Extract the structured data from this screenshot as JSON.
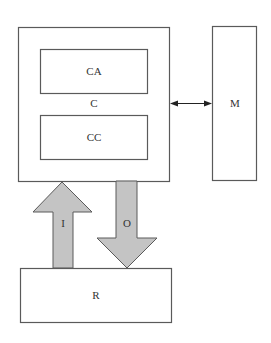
{
  "diagram": {
    "nodes": {
      "computer": {
        "label": "C"
      },
      "control_a": {
        "label": "CA"
      },
      "control_c": {
        "label": "CC"
      },
      "memory": {
        "label": "M"
      },
      "resource": {
        "label": "R"
      }
    },
    "flows": {
      "input": {
        "label": "I",
        "direction": "R to C"
      },
      "output": {
        "label": "O",
        "direction": "C to R"
      },
      "bidirectional": {
        "from": "C",
        "to": "M"
      }
    },
    "colors": {
      "box_stroke": "#5a5a5a",
      "arrow_fill": "#c4c4c4",
      "connector": "#222222"
    }
  }
}
